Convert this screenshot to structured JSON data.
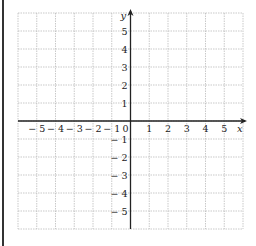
{
  "chart_data": {
    "type": "scatter",
    "title": "",
    "xlabel": "x",
    "ylabel": "y",
    "xlim": [
      -6,
      6
    ],
    "ylim": [
      -6,
      6
    ],
    "grid": true,
    "grid_style": "dotted",
    "x_ticks": [
      -5,
      -4,
      -3,
      -2,
      -1,
      0,
      1,
      2,
      3,
      4,
      5
    ],
    "y_ticks": [
      -5,
      -4,
      -3,
      -2,
      -1,
      1,
      2,
      3,
      4,
      5
    ],
    "x_tick_labels": [
      "− 5",
      "− 4",
      "− 3",
      "− 2",
      "− 1",
      "0",
      "1",
      "2",
      "3",
      "4",
      "5"
    ],
    "y_tick_labels": [
      "− 5",
      "− 4",
      "− 3",
      "− 2",
      "− 1",
      "1",
      "2",
      "3",
      "4",
      "5"
    ],
    "series": [],
    "legend": null
  },
  "colors": {
    "grid": "#bbbbbb",
    "axis": "#222222",
    "border": "#333333"
  }
}
